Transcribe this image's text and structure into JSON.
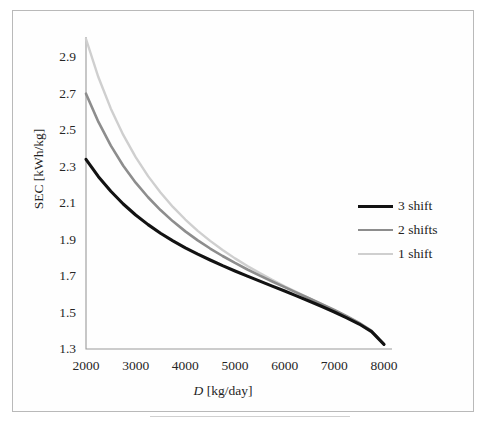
{
  "figure": {
    "background_color": "#ffffff",
    "frame_color": "#b9b9b9"
  },
  "chart_data": {
    "type": "line",
    "title": "",
    "xlabel": "D [kg/day]",
    "xlabel_variable": "D",
    "xlabel_units": "[kg/day]",
    "ylabel": "SEC [kWh/kg]",
    "xlim": [
      2000,
      8000
    ],
    "ylim": [
      1.3,
      3.0
    ],
    "xticks": [
      2000,
      3000,
      4000,
      5000,
      6000,
      7000,
      8000
    ],
    "yticks": [
      1.3,
      1.5,
      1.7,
      1.9,
      2.1,
      2.3,
      2.5,
      2.7,
      2.9
    ],
    "xtick_labels": [
      "2000",
      "3000",
      "4000",
      "5000",
      "6000",
      "7000",
      "8000"
    ],
    "ytick_labels": [
      "1.3",
      "1.5",
      "1.7",
      "1.9",
      "2.1",
      "2.3",
      "2.5",
      "2.7",
      "2.9"
    ],
    "grid": false,
    "legend_position": "right",
    "x": [
      2000,
      2250,
      2500,
      2750,
      3000,
      3250,
      3500,
      3750,
      4000,
      4250,
      4500,
      4750,
      5000,
      5250,
      5500,
      5750,
      6000,
      6250,
      6500,
      6750,
      7000,
      7250,
      7500,
      7750,
      8000
    ],
    "series": [
      {
        "name": "3 shift",
        "color": "#121212",
        "width": 3.1,
        "values": [
          2.34,
          2.245,
          2.165,
          2.095,
          2.035,
          1.982,
          1.935,
          1.893,
          1.855,
          1.82,
          1.788,
          1.757,
          1.728,
          1.7,
          1.672,
          1.645,
          1.618,
          1.59,
          1.562,
          1.533,
          1.503,
          1.471,
          1.437,
          1.395,
          1.325
        ]
      },
      {
        "name": "2 shifts",
        "color": "#8d8d8d",
        "width": 2.6,
        "values": [
          2.7,
          2.545,
          2.415,
          2.305,
          2.212,
          2.132,
          2.062,
          2.0,
          1.945,
          1.896,
          1.851,
          1.81,
          1.772,
          1.736,
          1.702,
          1.67,
          1.639,
          1.608,
          1.577,
          1.546,
          1.514,
          1.48,
          1.443,
          1.399,
          1.325
        ]
      },
      {
        "name": "1 shift",
        "color": "#cfcfcf",
        "width": 2.4,
        "values": [
          3.0,
          2.79,
          2.618,
          2.474,
          2.352,
          2.248,
          2.158,
          2.079,
          2.01,
          1.948,
          1.893,
          1.843,
          1.797,
          1.755,
          1.716,
          1.679,
          1.644,
          1.611,
          1.578,
          1.545,
          1.512,
          1.478,
          1.441,
          1.398,
          1.325
        ]
      }
    ]
  },
  "legend": {
    "items": [
      {
        "label": "3 shift",
        "color": "#121212",
        "thickness": 3.4
      },
      {
        "label": "2 shifts",
        "color": "#8d8d8d",
        "thickness": 2.8
      },
      {
        "label": "1 shift",
        "color": "#cfcfcf",
        "thickness": 2.4
      }
    ]
  }
}
